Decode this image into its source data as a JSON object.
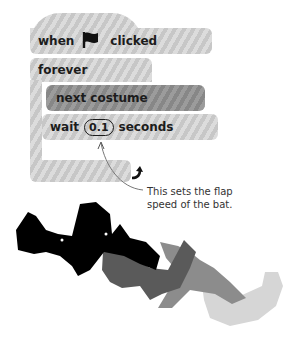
{
  "script": {
    "hat_block": {
      "prefix": "when",
      "icon": "green-flag-icon",
      "suffix": "clicked"
    },
    "forever_block": {
      "label": "forever",
      "loop_icon": "loop-arrow-icon"
    },
    "next_costume_block": {
      "label": "next costume"
    },
    "wait_block": {
      "prefix": "wait",
      "value": "0.1",
      "suffix": "seconds"
    }
  },
  "annotation": {
    "line1": "This sets the flap",
    "line2": "speed of the bat."
  },
  "illustration": {
    "description": "bat flapping animation sequence",
    "bat_colors": [
      "#000000",
      "#555555",
      "#8a8a8a",
      "#d3d3d3"
    ]
  }
}
